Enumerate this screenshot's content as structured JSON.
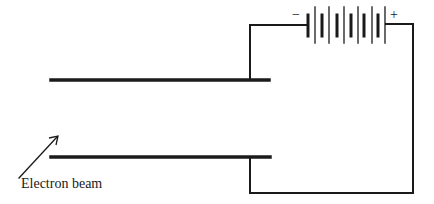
{
  "diagram": {
    "colors": {
      "line": "#1a1a1a",
      "background": "#ffffff"
    },
    "labels": {
      "electron_beam": "Electron beam",
      "battery_negative": "−",
      "battery_positive": "+"
    },
    "components": {
      "top_plate": {
        "x1": 51,
        "x2": 269,
        "y": 80
      },
      "bottom_plate": {
        "x1": 51,
        "x2": 270,
        "y": 157
      },
      "battery": {
        "cells": 5,
        "negative_side": "left",
        "positive_side": "right"
      },
      "arrow": {
        "from": [
          19,
          178
        ],
        "to": [
          58,
          136
        ]
      }
    }
  }
}
